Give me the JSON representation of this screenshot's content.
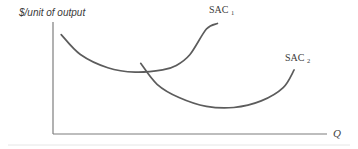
{
  "chart_data": {
    "type": "line",
    "title": "",
    "ylabel": "$/unit of output",
    "xlabel": "Q",
    "grid": false,
    "legend": "none",
    "series": [
      {
        "name": "SAC",
        "subscript": "1",
        "description": "Short-run average cost curve 1 (U-shaped, higher and to the left)",
        "shape": "u-shaped",
        "x": [
          0.03,
          0.1,
          0.2,
          0.3,
          0.4,
          0.45,
          0.5,
          0.56,
          0.6
        ],
        "y": [
          0.9,
          0.72,
          0.6,
          0.56,
          0.58,
          0.62,
          0.72,
          0.95,
          1.0
        ]
      },
      {
        "name": "SAC",
        "subscript": "2",
        "description": "Short-run average cost curve 2 (U-shaped, lower and to the right)",
        "shape": "u-shaped",
        "x": [
          0.32,
          0.38,
          0.46,
          0.56,
          0.66,
          0.76,
          0.84,
          0.88
        ],
        "y": [
          0.64,
          0.45,
          0.33,
          0.25,
          0.24,
          0.3,
          0.42,
          0.58
        ]
      }
    ],
    "xlim": [
      0,
      1
    ],
    "ylim": [
      0,
      1.05
    ]
  },
  "labels": {
    "y_axis_title": "$/unit of output",
    "x_axis_label": "Q",
    "sac1_main": "SAC",
    "sac1_sub": "1",
    "sac2_main": "SAC",
    "sac2_sub": "2"
  }
}
